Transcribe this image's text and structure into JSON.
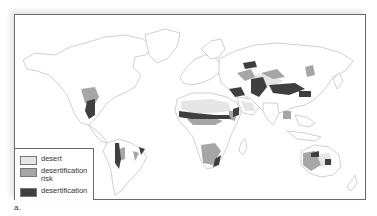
{
  "figure": {
    "caption": "a."
  },
  "legend": {
    "items": [
      {
        "label": "desert",
        "color": "#e6e6e6"
      },
      {
        "label": "desertification risk",
        "label_line1": "desertification",
        "label_line2": "risk",
        "color": "#a6a6a6"
      },
      {
        "label": "desertification",
        "color": "#3f3f3f"
      }
    ]
  },
  "colors": {
    "land": "#ffffff",
    "coastline": "#c8c8c8",
    "frame": "#6a6a6a",
    "desert": "#e6e6e6",
    "risk": "#a6a6a6",
    "desertification": "#3f3f3f"
  }
}
